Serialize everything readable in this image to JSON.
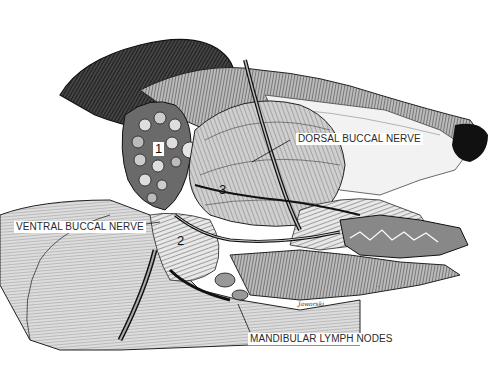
{
  "figure": {
    "labels": {
      "dorsal_buccal_nerve": "DORSAL BUCCAL NERVE",
      "ventral_buccal_nerve": "VENTRAL BUCCAL NERVE",
      "mandibular_lymph_nodes": "MANDIBULAR LYMPH NODES"
    },
    "numbers": {
      "n1": "1",
      "n2": "2",
      "n3": "3"
    },
    "signature": "Jaworski"
  },
  "colors": {
    "background": "#ffffff",
    "ink": "#111111",
    "label_text": "#2a2a2a"
  }
}
